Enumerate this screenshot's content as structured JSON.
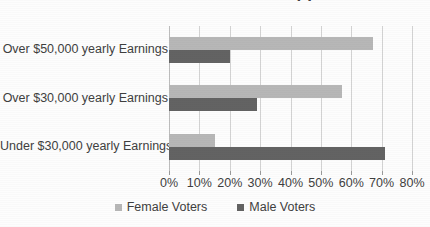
{
  "chart_data": {
    "type": "bar",
    "orientation": "horizontal",
    "title": "Senator Perkins Voter Support",
    "xlabel": "",
    "ylabel": "",
    "categories": [
      "Over $50,000 yearly Earnings",
      "Over $30,000 yearly Earnings",
      "Under $30,000 yearly Earnings"
    ],
    "series": [
      {
        "name": "Female Voters",
        "color": "#b7b7b7",
        "values": [
          67,
          57,
          15
        ]
      },
      {
        "name": "Male Voters",
        "color": "#636363",
        "values": [
          20,
          29,
          71
        ]
      }
    ],
    "xlim": [
      0,
      80
    ],
    "xticks": [
      0,
      10,
      20,
      30,
      40,
      50,
      60,
      70,
      80
    ],
    "xtick_labels": [
      "0%",
      "10%",
      "20%",
      "30%",
      "40%",
      "50%",
      "60%",
      "70%",
      "80%"
    ],
    "value_suffix": "%",
    "grid": true,
    "grid_axis": "x",
    "legend_position": "bottom"
  },
  "legend": {
    "items": [
      {
        "label": "Female Voters",
        "swatch": "female-legend-swatch"
      },
      {
        "label": "Male Voters",
        "swatch": "male-legend-swatch"
      }
    ]
  },
  "colors": {
    "female": "#b7b7b7",
    "male": "#636363",
    "gridline": "#d3d3d3",
    "text": "#3f3f3f",
    "background": "#fdfdfd"
  }
}
